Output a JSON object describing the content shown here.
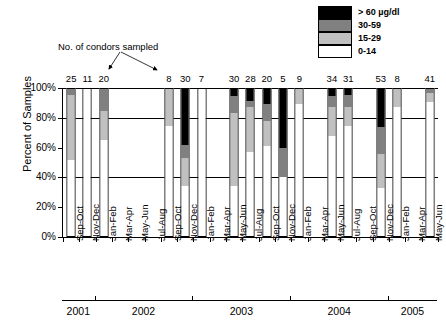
{
  "annotation": {
    "text": "No. of condors sampled"
  },
  "legend": {
    "position": "top-right",
    "items": [
      {
        "label": "> 60 µg/dl",
        "color": "#000000",
        "name": "legend-over60"
      },
      {
        "label": "30-59",
        "color": "#808080",
        "name": "legend-30-59"
      },
      {
        "label": "15-29",
        "color": "#c0c0c0",
        "name": "legend-15-29"
      },
      {
        "label": "0-14",
        "color": "#ffffff",
        "name": "legend-0-14"
      }
    ]
  },
  "axes": {
    "ylabel": "Percent of Samples",
    "yticks": [
      "0%",
      "20%",
      "40%",
      "60%",
      "80%",
      "100%"
    ],
    "ytick_values": [
      0,
      20,
      40,
      60,
      80,
      100
    ],
    "gridlines_at": [
      40,
      80,
      100
    ],
    "years": [
      "2001",
      "2002",
      "2003",
      "2004",
      "2005"
    ]
  },
  "chart_data": {
    "type": "bar",
    "title": "",
    "xlabel": "",
    "ylabel": "Percent of Samples",
    "ylim": [
      0,
      100
    ],
    "grid": true,
    "stacked": true,
    "stack_order_bottom_to_top": [
      "0-14",
      "15-29",
      "30-59",
      "> 60 µg/dl"
    ],
    "legend_position": "top-right",
    "categories": [
      "Sep-Oct",
      "Nov-Dec",
      "Jan-Feb",
      "Mar-Apr",
      "May-Jun",
      "Jul-Aug",
      "Sep-Oct",
      "Nov-Dec",
      "Jan-Feb",
      "Mar-Apr",
      "May-Jun",
      "Jul-Aug",
      "Sep-Oct",
      "Nov-Dec",
      "Jan-Feb",
      "Mar-Apr",
      "May-Jun",
      "Jul-Aug",
      "Sep-Oct",
      "Nov-Dec",
      "Jan-Feb",
      "Mar-Apr",
      "May-Jun"
    ],
    "year_groups": [
      {
        "year": "2001",
        "start_index": 0,
        "count": 2
      },
      {
        "year": "2002",
        "start_index": 2,
        "count": 6
      },
      {
        "year": "2003",
        "start_index": 8,
        "count": 6
      },
      {
        "year": "2004",
        "start_index": 14,
        "count": 6
      },
      {
        "year": "2005",
        "start_index": 20,
        "count": 3
      }
    ],
    "series": [
      {
        "name": "0-14",
        "color": "#ffffff",
        "values": [
          52,
          100,
          65,
          null,
          null,
          null,
          75,
          34,
          100,
          null,
          34,
          57,
          61,
          40,
          90,
          null,
          68,
          75,
          null,
          33,
          88,
          null,
          91
        ]
      },
      {
        "name": "15-29",
        "color": "#c0c0c0",
        "values": [
          44,
          0,
          20,
          null,
          null,
          null,
          25,
          19,
          0,
          null,
          50,
          31,
          17,
          0,
          10,
          null,
          20,
          13,
          null,
          23,
          12,
          null,
          6
        ]
      },
      {
        "name": "30-59",
        "color": "#808080",
        "values": [
          4,
          0,
          15,
          null,
          null,
          null,
          0,
          9,
          0,
          null,
          11,
          4,
          12,
          20,
          0,
          null,
          7,
          8,
          null,
          18,
          0,
          null,
          3
        ]
      },
      {
        "name": "> 60 µg/dl",
        "color": "#000000",
        "values": [
          0,
          0,
          0,
          null,
          null,
          null,
          0,
          38,
          0,
          null,
          5,
          8,
          10,
          40,
          0,
          null,
          5,
          4,
          null,
          26,
          0,
          null,
          0
        ]
      }
    ],
    "sample_counts": [
      25,
      11,
      20,
      null,
      null,
      null,
      8,
      30,
      7,
      null,
      30,
      28,
      20,
      5,
      9,
      null,
      34,
      31,
      null,
      53,
      8,
      null,
      41
    ],
    "sample_count_annotation": "No. of condors sampled"
  }
}
